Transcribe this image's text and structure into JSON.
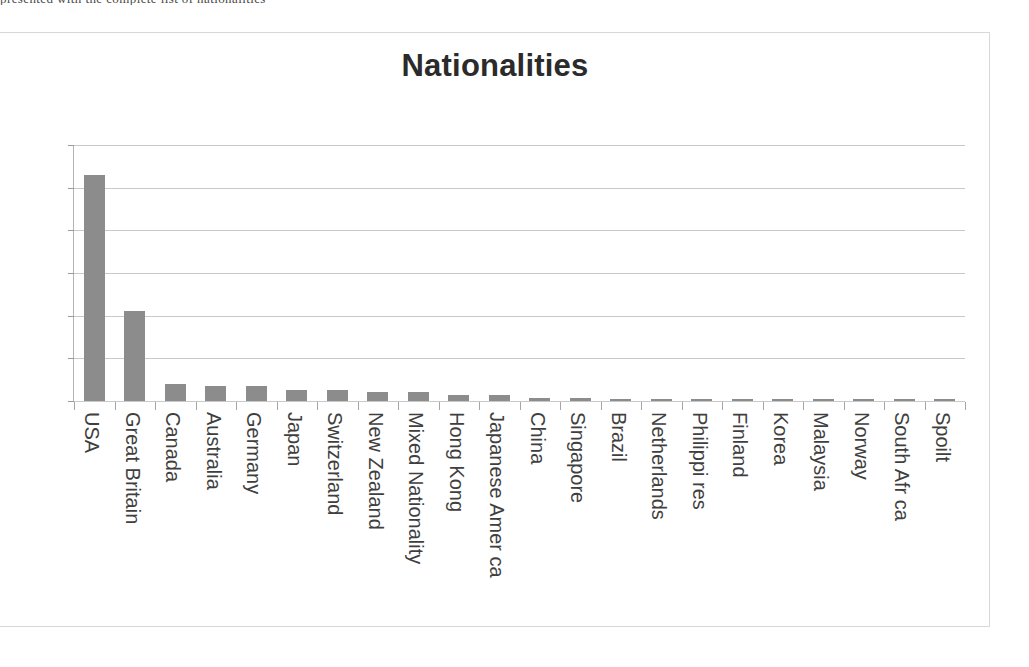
{
  "scan": {
    "top_cut_text": "presented with the complete list of nationalities"
  },
  "chart_data": {
    "type": "bar",
    "title": "Nationalities",
    "xlabel": "",
    "ylabel": "",
    "ylim": [
      0,
      120
    ],
    "yticks": [
      0,
      20,
      40,
      60,
      80,
      100,
      120
    ],
    "ytick_labels": [
      "0",
      "20",
      "40",
      "60",
      "80",
      "100",
      "120"
    ],
    "grid": true,
    "legend": false,
    "bar_color": "#8c8c8c",
    "categories": [
      "USA",
      "Great Britain",
      "Canada",
      "Australia",
      "Germany",
      "Japan",
      "Switzerland",
      "New Zealand",
      "Mixed Nationality",
      "Hong Kong",
      "Japanese Amer ca",
      "China",
      "Singapore",
      "Brazil",
      "Netherlands",
      "Philippi res",
      "Finland",
      "Korea",
      "Malaysia",
      "Norway",
      "South Afr ca",
      "Spoilt"
    ],
    "values": [
      106,
      42,
      8,
      7,
      7,
      5,
      5,
      4,
      4,
      3,
      3,
      1.5,
      1.5,
      1,
      1,
      1,
      1,
      1,
      1,
      1,
      1,
      1
    ]
  }
}
